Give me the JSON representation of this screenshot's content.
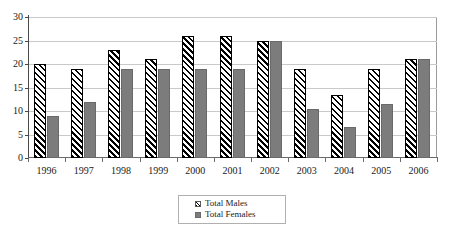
{
  "chart_data": {
    "type": "bar",
    "title": "",
    "xlabel": "",
    "ylabel": "",
    "ylim": [
      0,
      30
    ],
    "yticks": [
      0,
      5,
      10,
      15,
      20,
      25,
      30
    ],
    "grid": true,
    "legend_position": "bottom",
    "categories": [
      "1996",
      "1997",
      "1998",
      "1999",
      "2000",
      "2001",
      "2002",
      "2003",
      "2004",
      "2005",
      "2006"
    ],
    "series": [
      {
        "name": "Total Males",
        "pattern": "diagonal-hatch",
        "color": "#ffffff",
        "values": [
          20,
          19,
          23,
          21,
          26,
          26,
          25,
          19,
          13.5,
          19,
          21
        ]
      },
      {
        "name": "Total Females",
        "pattern": "solid",
        "color": "#7c7c7c",
        "values": [
          9,
          12,
          19,
          19,
          19,
          19,
          25,
          10.5,
          6.5,
          11.5,
          21
        ]
      }
    ]
  },
  "legend": {
    "items": [
      {
        "label": "Total Males"
      },
      {
        "label": "Total Females"
      }
    ]
  }
}
